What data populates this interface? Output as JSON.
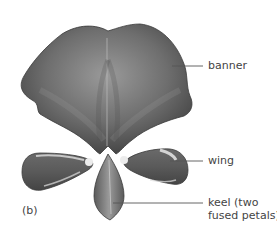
{
  "figure": {
    "panel_letter": "(b)"
  },
  "labels": {
    "banner": "banner",
    "wing": "wing",
    "keel": "keel (two\nfused petals)"
  },
  "colors": {
    "petal_dark": "#4a4a4a",
    "petal_mid": "#7a7a7a",
    "petal_light": "#c8c8c8",
    "leader_line": "#555555",
    "text": "#444444"
  }
}
